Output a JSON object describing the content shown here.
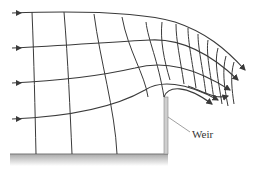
{
  "diagram": {
    "labels": {
      "weir": "Weir"
    },
    "elements": {
      "streamlines": 4,
      "equipotential_lines": "many",
      "inflow_arrows": 4,
      "outflow_arrows": 6
    },
    "colors": {
      "lines": "#3a3a3a",
      "ground": "#b8b8b8",
      "weir": "#c8c8c8",
      "leader": "#888888"
    }
  }
}
